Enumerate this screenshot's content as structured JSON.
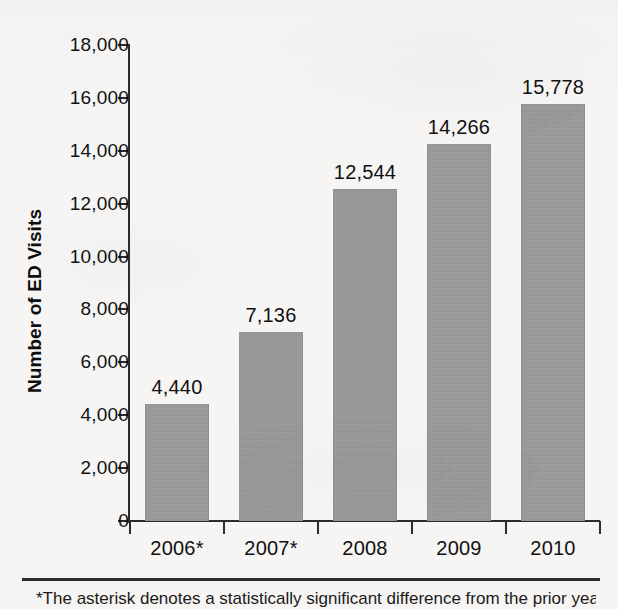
{
  "chart_data": {
    "type": "bar",
    "title": "",
    "subtitle": "",
    "xlabel": "",
    "ylabel": "Number of ED Visits",
    "categories": [
      "2006*",
      "2007*",
      "2008",
      "2009",
      "2010"
    ],
    "values": [
      4440,
      7136,
      12544,
      14266,
      15778
    ],
    "value_labels": [
      "4,440",
      "7,136",
      "12,544",
      "14,266",
      "15,778"
    ],
    "series": [
      {
        "name": "Number of ED Visits",
        "values": [
          4440,
          7136,
          12544,
          14266,
          15778
        ]
      }
    ],
    "ylim": [
      0,
      18000
    ],
    "ytick_values": [
      0,
      2000,
      4000,
      6000,
      8000,
      10000,
      12000,
      14000,
      16000,
      18000
    ],
    "ytick_labels": [
      "0",
      "2,000",
      "4,000",
      "6,000",
      "8,000",
      "10,000",
      "12,000",
      "14,000",
      "16,000",
      "18,000"
    ],
    "grid": false,
    "legend": false,
    "legend_position": "none",
    "bar_color": "#999a9a",
    "axis_color": "#2b2b2b",
    "background_color": "#f6f5f3",
    "annotations": [
      "*"
    ]
  },
  "footer": {
    "footnote": "*The asterisk denotes a statistically significant difference from the prior year."
  }
}
